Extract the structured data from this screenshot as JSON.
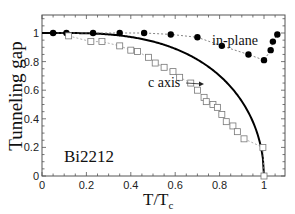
{
  "chart_data": {
    "type": "scatter",
    "title": "",
    "xlabel": "T/T",
    "xlabel_sub": "c",
    "ylabel": "Tunneling gap",
    "xlim": [
      0,
      1.1
    ],
    "ylim": [
      0,
      1.1
    ],
    "xticks": [
      0,
      0.2,
      0.4,
      0.6,
      0.8,
      1
    ],
    "xtick_labels": [
      "0",
      "0.2",
      "0.4",
      "0.6",
      "0.8",
      "1"
    ],
    "yticks": [
      0,
      0.2,
      0.4,
      0.6,
      0.8,
      1
    ],
    "ytick_labels": [
      "0",
      "0.2",
      "0.4",
      "0.6",
      "0.8",
      "1"
    ],
    "grid": false,
    "legend": null,
    "annotations": [
      {
        "text": "in-plane",
        "x": 0.83,
        "y": 0.94
      },
      {
        "text": "c axis",
        "x": 0.55,
        "y": 0.7,
        "arrow_to": [
          0.74,
          0.72
        ]
      },
      {
        "text": "Bi2212",
        "x": 0.1,
        "y": 0.17
      }
    ],
    "series": [
      {
        "name": "in-plane",
        "marker": "filled-circle",
        "line": "dotted",
        "color": "#000000",
        "x": [
          0.05,
          0.11,
          0.23,
          0.35,
          0.46,
          0.58,
          0.7,
          0.81,
          0.93,
          1.0,
          1.03,
          1.04,
          1.06
        ],
        "y": [
          1.0,
          1.0,
          1.0,
          1.0,
          1.0,
          0.99,
          0.97,
          0.91,
          0.85,
          0.81,
          0.88,
          0.94,
          0.99
        ]
      },
      {
        "name": "c axis",
        "marker": "open-square",
        "line": "dotted",
        "color": "#777777",
        "x": [
          0.12,
          0.22,
          0.27,
          0.35,
          0.4,
          0.43,
          0.48,
          0.51,
          0.55,
          0.59,
          0.62,
          0.67,
          0.7,
          0.73,
          0.74,
          0.77,
          0.79,
          0.81,
          0.83,
          0.86,
          0.88,
          0.91,
          0.995,
          1.0
        ],
        "y": [
          0.98,
          0.94,
          0.94,
          0.91,
          0.88,
          0.87,
          0.83,
          0.79,
          0.76,
          0.73,
          0.69,
          0.65,
          0.6,
          0.55,
          0.52,
          0.5,
          0.48,
          0.43,
          0.38,
          0.35,
          0.31,
          0.26,
          0.2,
          0.0
        ]
      },
      {
        "name": "BCS",
        "marker": "none",
        "line": "solid",
        "color": "#000000",
        "x": [
          0,
          0.1,
          0.2,
          0.3,
          0.4,
          0.5,
          0.6,
          0.7,
          0.8,
          0.85,
          0.9,
          0.95,
          0.98,
          1.0
        ],
        "y": [
          1.0,
          1.0,
          1.0,
          0.998,
          0.986,
          0.952,
          0.902,
          0.818,
          0.694,
          0.61,
          0.508,
          0.361,
          0.23,
          0.0
        ]
      }
    ]
  }
}
